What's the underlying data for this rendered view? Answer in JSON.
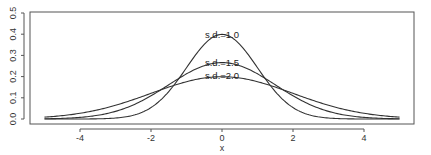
{
  "chart_data": {
    "type": "line",
    "title": "",
    "xlabel": "x",
    "ylabel": "",
    "xlim": [
      -5,
      5
    ],
    "ylim": [
      0,
      0.5
    ],
    "x_ticks": [
      -4,
      -2,
      0,
      2,
      4
    ],
    "x_tick_labels": [
      "-4",
      "-2",
      "0",
      "2",
      "4"
    ],
    "y_ticks": [
      0.0,
      0.1,
      0.2,
      0.3,
      0.4,
      0.5
    ],
    "y_tick_labels": [
      "0.0",
      "0.1",
      "0.2",
      "0.3",
      "0.4",
      "0.5"
    ],
    "grid": false,
    "legend": "none (curves labeled directly)",
    "series": [
      {
        "name": "s.d.=1.0",
        "label": "s.d.=1.0",
        "mean": 0,
        "sd": 1.0,
        "peak": 0.399,
        "x": [
          -5,
          -4,
          -3,
          -2,
          -1,
          0,
          1,
          2,
          3,
          4,
          5
        ],
        "values": [
          0.0,
          0.0001,
          0.0044,
          0.054,
          0.242,
          0.3989,
          0.242,
          0.054,
          0.0044,
          0.0001,
          0.0
        ]
      },
      {
        "name": "s.d.=1.5",
        "label": "s.d.=1.5",
        "mean": 0,
        "sd": 1.5,
        "peak": 0.266,
        "x": [
          -5,
          -4,
          -3,
          -2,
          -1,
          0,
          1,
          2,
          3,
          4,
          5
        ],
        "values": [
          0.001,
          0.0076,
          0.036,
          0.1093,
          0.213,
          0.266,
          0.213,
          0.1093,
          0.036,
          0.0076,
          0.001
        ]
      },
      {
        "name": "s.d.=2.0",
        "label": "s.d.=2.0",
        "mean": 0,
        "sd": 2.0,
        "peak": 0.199,
        "x": [
          -5,
          -4,
          -3,
          -2,
          -1,
          0,
          1,
          2,
          3,
          4,
          5
        ],
        "values": [
          0.0088,
          0.027,
          0.0648,
          0.121,
          0.176,
          0.1995,
          0.176,
          0.121,
          0.0648,
          0.027,
          0.0088
        ]
      }
    ]
  },
  "labels": {
    "sd1": "s.d.=1.0",
    "sd15": "s.d.=1.5",
    "sd2": "s.d.=2.0",
    "xlabel": "x"
  }
}
